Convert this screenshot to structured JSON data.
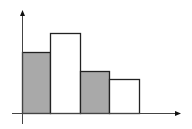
{
  "chart_data": {
    "type": "bar",
    "title": "",
    "xlabel": "",
    "ylabel": "",
    "categories": [
      "1",
      "2",
      "3",
      "4"
    ],
    "values": [
      61,
      80,
      42,
      34
    ],
    "fills": [
      "#a9a9a9",
      "#ffffff",
      "#a9a9a9",
      "#ffffff"
    ],
    "bar_stroke": "#222222",
    "axis_color": "#444444",
    "grid": false,
    "legend": null,
    "ylim": [
      0,
      103
    ]
  },
  "layout": {
    "origin_x": 22,
    "origin_y": 113,
    "bar_edges_x": [
      22,
      50,
      80,
      109,
      139
    ],
    "y_axis_top": 10,
    "y_axis_bottom": 124,
    "x_axis_left": 12,
    "x_axis_right": 181
  }
}
